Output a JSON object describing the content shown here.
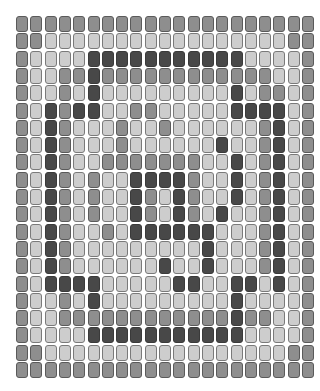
{
  "board": {
    "cols": 21,
    "rows": 21,
    "cell_pitch_x": 14.3,
    "cell_pitch_y": 17.3,
    "legend": {
      "M": {
        "name": "mid-gray",
        "color": "#8e8e8e"
      },
      "L": {
        "name": "light-gray",
        "color": "#cdcdcd"
      },
      "D": {
        "name": "dark-gray",
        "color": "#484848"
      }
    },
    "grid": [
      "MMMMMMMMMMMMMMMMMMMMM",
      "MMLLLLLLLLLLLLLLLLLMM",
      "MLLLLDDDDDDDDDDDLLLLM",
      "MLLMMDMMMMMMMMMMMMLLM",
      "MLLMLDLLLLLLLLLDLMMLM",
      "MLDMDDLLMMLLLLLDDDDLM",
      "MLDMLLLMLLMLLLLLLMDLM",
      "MLDMLLLMLLLLLLDLLMDLM",
      "MLDMLLMMMMMMMLLDLMDLM",
      "MLDMLMLLDDDDMLLDLMDLM",
      "MLDMLMLLDMLDMLLDLMDLM",
      "MLDMLMLLDMLDMLDLLMDLM",
      "MLDMLLMLDDDDDDLLLMDLM",
      "MLDMLLLLLLLLLDLLLMDLM",
      "MLDMLLLLLLDLLDLLLMDLM",
      "MLDDDDLLLLLDDLLDDLDLM",
      "MLLMLDLLLLLLLLLDLLLLM",
      "MLLMMMMMMMMMMMMDMMLLM",
      "MLLLLDDDDDDDDDDDLLLLM",
      "MMLLLLLLLLLLLLLLLLLMM",
      "MMMMMMMMMMMMMMMMMMMMM"
    ]
  }
}
